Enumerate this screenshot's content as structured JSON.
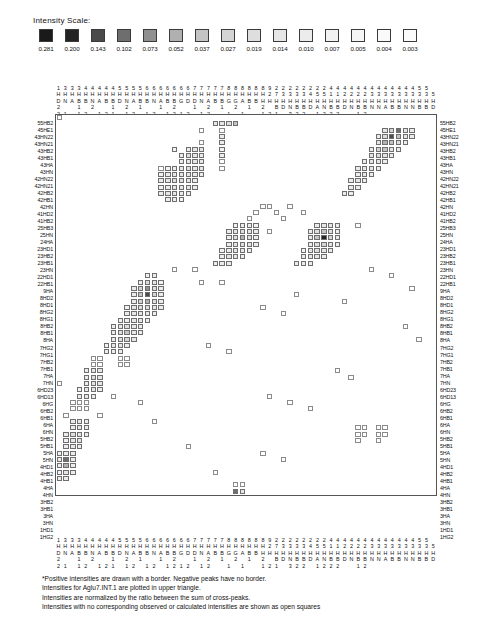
{
  "legend": {
    "title": "Intensity Scale:",
    "values": [
      "0.281",
      "0.200",
      "0.143",
      "0.102",
      "0.073",
      "0.052",
      "0.037",
      "0.027",
      "0.019",
      "0.014",
      "0.010",
      "0.007",
      "0.005",
      "0.004",
      "0.003"
    ],
    "colors": [
      "#1a1a1a",
      "#242424",
      "#4a4a4a",
      "#6e6e6e",
      "#909090",
      "#b0b0b0",
      "#c4c4c4",
      "#d4d4d4",
      "#dedede",
      "#e6e6e6",
      "#ececec",
      "#f2f2f2",
      "#f6f6f6",
      "#f9f9f9",
      "#fbfbfb"
    ]
  },
  "footnotes": [
    "*Positive intensities are drawn with a border.  Negative peaks have no border.",
    "Intensities for Aglu7.INT.1 are plotted in upper triangle.",
    "Intensities are normalized by the ratio between the sum of cross-peaks.",
    "Intensities with no corresponding observed or calculated intensities are shown as open squares"
  ],
  "axis": {
    "row_labels": [
      "55HB2",
      "45HE1",
      "43HN22",
      "43HN21",
      "43HB2",
      "43HB1",
      "43HA",
      "43HN",
      "42HN22",
      "42HN21",
      "42HB2",
      "42HB1",
      "42HN",
      "41HD2",
      "41HB2",
      "25HB3",
      "25HN",
      "24HA",
      "23HD1",
      "23HB2",
      "23HB1",
      "23HN",
      "22HD1",
      "22HB1",
      "9HA",
      "8HD2",
      "8HD1",
      "8HG2",
      "8HG1",
      "8HB2",
      "8HB1",
      "8HA",
      "7HG2",
      "7HG1",
      "7HB2",
      "7HB1",
      "7HA",
      "7HN",
      "6HD23",
      "6HD13",
      "6HG",
      "6HB2",
      "6HB1",
      "6HA",
      "6HN",
      "5HB2",
      "5HB1",
      "5HA",
      "5HN",
      "4HD1",
      "4HB2",
      "4HB1",
      "4HA",
      "4HN",
      "3HB2",
      "3HB1",
      "3HA",
      "3HN",
      "1HD1",
      "1HG2"
    ],
    "col_rows": [
      "1333444445555666666677777888888922222222444444444444455",
      "HHHHHHHHHHHHHHHHHHHHHHHHHHHHHHH2733334551122223333333335",
      "DNABBNABBDNABBNABBGDDNABBGGABBHHHHHHHHHHHHHHHHHHHHHHHHHH",
      "2  1 2  1 2 1  1 2  1 2 1 2 1 2 BDNBBDANBBDNBBNNABBNNBBD"
    ],
    "col_row4": "21 12 121 12 12 1212 12  1 1  121 322 1222  12"
  },
  "chart_data": {
    "type": "heatmap",
    "xlabel": "",
    "ylabel": "",
    "n_rows": 60,
    "n_cols": 56,
    "legend_position": "top",
    "scale_values": [
      0.281,
      0.2,
      0.143,
      0.102,
      0.073,
      0.052,
      0.037,
      0.027,
      0.019,
      0.014,
      0.01,
      0.007,
      0.005,
      0.004,
      0.003
    ],
    "note": "Cells encoded as [col, row, level] where level 0..14 maps to scale_values (0=darkest), level -1 = open square (no intensity).",
    "cells": [
      [
        0,
        0,
        -1
      ],
      [
        0,
        42,
        -1
      ],
      [
        23,
        1,
        9
      ],
      [
        24,
        1,
        9
      ],
      [
        25,
        1,
        8
      ],
      [
        26,
        1,
        6
      ],
      [
        21,
        2,
        -1
      ],
      [
        24,
        2,
        -1
      ],
      [
        24,
        3,
        10
      ],
      [
        21,
        4,
        -1
      ],
      [
        24,
        4,
        10
      ],
      [
        17,
        5,
        11
      ],
      [
        19,
        5,
        10
      ],
      [
        20,
        5,
        9
      ],
      [
        21,
        5,
        9
      ],
      [
        24,
        5,
        11
      ],
      [
        18,
        6,
        10
      ],
      [
        19,
        6,
        8
      ],
      [
        20,
        6,
        9
      ],
      [
        21,
        6,
        10
      ],
      [
        24,
        6,
        10
      ],
      [
        18,
        7,
        10
      ],
      [
        19,
        7,
        9
      ],
      [
        20,
        7,
        9
      ],
      [
        21,
        7,
        9
      ],
      [
        24,
        7,
        -1
      ],
      [
        15,
        8,
        -1
      ],
      [
        16,
        8,
        11
      ],
      [
        17,
        8,
        10
      ],
      [
        18,
        8,
        9
      ],
      [
        19,
        8,
        8
      ],
      [
        20,
        8,
        9
      ],
      [
        21,
        8,
        9
      ],
      [
        24,
        8,
        -1
      ],
      [
        15,
        9,
        11
      ],
      [
        16,
        9,
        10
      ],
      [
        17,
        9,
        9
      ],
      [
        18,
        9,
        9
      ],
      [
        19,
        9,
        9
      ],
      [
        20,
        9,
        10
      ],
      [
        21,
        9,
        10
      ],
      [
        15,
        10,
        10
      ],
      [
        16,
        10,
        9
      ],
      [
        17,
        10,
        8
      ],
      [
        18,
        10,
        8
      ],
      [
        19,
        10,
        9
      ],
      [
        20,
        10,
        10
      ],
      [
        15,
        11,
        11
      ],
      [
        16,
        11,
        10
      ],
      [
        17,
        11,
        9
      ],
      [
        18,
        11,
        9
      ],
      [
        19,
        11,
        9
      ],
      [
        20,
        11,
        10
      ],
      [
        15,
        12,
        10
      ],
      [
        16,
        12,
        9
      ],
      [
        17,
        12,
        9
      ],
      [
        18,
        12,
        10
      ],
      [
        19,
        12,
        10
      ],
      [
        16,
        13,
        10
      ],
      [
        17,
        13,
        10
      ],
      [
        18,
        13,
        11
      ],
      [
        48,
        2,
        9
      ],
      [
        49,
        2,
        7
      ],
      [
        50,
        2,
        3
      ],
      [
        51,
        2,
        9
      ],
      [
        52,
        2,
        10
      ],
      [
        47,
        3,
        10
      ],
      [
        48,
        3,
        8
      ],
      [
        49,
        3,
        2
      ],
      [
        50,
        3,
        6
      ],
      [
        51,
        3,
        9
      ],
      [
        52,
        3,
        10
      ],
      [
        47,
        4,
        9
      ],
      [
        48,
        4,
        5
      ],
      [
        49,
        4,
        6
      ],
      [
        50,
        4,
        8
      ],
      [
        51,
        4,
        10
      ],
      [
        46,
        5,
        10
      ],
      [
        47,
        5,
        7
      ],
      [
        48,
        5,
        6
      ],
      [
        49,
        5,
        9
      ],
      [
        50,
        5,
        10
      ],
      [
        46,
        6,
        9
      ],
      [
        47,
        6,
        8
      ],
      [
        48,
        6,
        9
      ],
      [
        49,
        6,
        10
      ],
      [
        45,
        7,
        10
      ],
      [
        46,
        7,
        9
      ],
      [
        47,
        7,
        9
      ],
      [
        48,
        7,
        10
      ],
      [
        44,
        8,
        10
      ],
      [
        45,
        8,
        9
      ],
      [
        46,
        8,
        9
      ],
      [
        47,
        8,
        10
      ],
      [
        44,
        9,
        10
      ],
      [
        45,
        9,
        9
      ],
      [
        46,
        9,
        10
      ],
      [
        43,
        10,
        10
      ],
      [
        44,
        10,
        9
      ],
      [
        45,
        10,
        10
      ],
      [
        43,
        11,
        10
      ],
      [
        44,
        11,
        10
      ],
      [
        42,
        12,
        10
      ],
      [
        43,
        12,
        10
      ],
      [
        30,
        14,
        -1
      ],
      [
        31,
        14,
        -1
      ],
      [
        34,
        14,
        -1
      ],
      [
        29,
        15,
        -1
      ],
      [
        32,
        15,
        -1
      ],
      [
        36,
        15,
        -1
      ],
      [
        28,
        16,
        -1
      ],
      [
        33,
        16,
        -1
      ],
      [
        26,
        17,
        11
      ],
      [
        27,
        17,
        10
      ],
      [
        28,
        17,
        10
      ],
      [
        29,
        17,
        11
      ],
      [
        25,
        18,
        10
      ],
      [
        26,
        18,
        9
      ],
      [
        27,
        18,
        8
      ],
      [
        28,
        18,
        9
      ],
      [
        29,
        18,
        10
      ],
      [
        31,
        18,
        -1
      ],
      [
        25,
        19,
        10
      ],
      [
        26,
        19,
        8
      ],
      [
        27,
        19,
        5
      ],
      [
        28,
        19,
        8
      ],
      [
        29,
        19,
        10
      ],
      [
        25,
        20,
        10
      ],
      [
        26,
        20,
        9
      ],
      [
        27,
        20,
        8
      ],
      [
        28,
        20,
        9
      ],
      [
        29,
        20,
        10
      ],
      [
        24,
        21,
        11
      ],
      [
        25,
        21,
        10
      ],
      [
        26,
        21,
        9
      ],
      [
        27,
        21,
        9
      ],
      [
        28,
        21,
        10
      ],
      [
        24,
        22,
        10
      ],
      [
        25,
        22,
        9
      ],
      [
        26,
        22,
        9
      ],
      [
        27,
        22,
        10
      ],
      [
        23,
        23,
        10
      ],
      [
        24,
        23,
        10
      ],
      [
        25,
        23,
        10
      ],
      [
        38,
        17,
        10
      ],
      [
        39,
        17,
        9
      ],
      [
        40,
        17,
        9
      ],
      [
        41,
        17,
        10
      ],
      [
        44,
        17,
        -1
      ],
      [
        37,
        18,
        10
      ],
      [
        38,
        18,
        8
      ],
      [
        39,
        18,
        6
      ],
      [
        40,
        18,
        8
      ],
      [
        41,
        18,
        10
      ],
      [
        37,
        19,
        9
      ],
      [
        38,
        19,
        6
      ],
      [
        39,
        19,
        1
      ],
      [
        40,
        19,
        7
      ],
      [
        41,
        19,
        9
      ],
      [
        37,
        20,
        10
      ],
      [
        38,
        20,
        8
      ],
      [
        39,
        20,
        7
      ],
      [
        40,
        20,
        9
      ],
      [
        41,
        20,
        10
      ],
      [
        36,
        21,
        11
      ],
      [
        37,
        21,
        9
      ],
      [
        38,
        21,
        8
      ],
      [
        39,
        21,
        9
      ],
      [
        40,
        21,
        10
      ],
      [
        36,
        22,
        10
      ],
      [
        37,
        22,
        9
      ],
      [
        38,
        22,
        9
      ],
      [
        39,
        22,
        10
      ],
      [
        35,
        23,
        10
      ],
      [
        36,
        23,
        10
      ],
      [
        37,
        23,
        10
      ],
      [
        13,
        25,
        11
      ],
      [
        14,
        25,
        10
      ],
      [
        12,
        26,
        10
      ],
      [
        13,
        26,
        8
      ],
      [
        14,
        26,
        9
      ],
      [
        15,
        26,
        11
      ],
      [
        11,
        27,
        10
      ],
      [
        12,
        27,
        7
      ],
      [
        13,
        27,
        4
      ],
      [
        14,
        27,
        8
      ],
      [
        15,
        27,
        10
      ],
      [
        11,
        28,
        10
      ],
      [
        12,
        28,
        6
      ],
      [
        13,
        28,
        2
      ],
      [
        14,
        28,
        7
      ],
      [
        15,
        28,
        10
      ],
      [
        11,
        29,
        10
      ],
      [
        12,
        29,
        7
      ],
      [
        13,
        29,
        5
      ],
      [
        14,
        29,
        8
      ],
      [
        15,
        29,
        10
      ],
      [
        10,
        30,
        11
      ],
      [
        11,
        30,
        9
      ],
      [
        12,
        30,
        8
      ],
      [
        13,
        30,
        8
      ],
      [
        14,
        30,
        9
      ],
      [
        15,
        30,
        10
      ],
      [
        10,
        31,
        10
      ],
      [
        11,
        31,
        9
      ],
      [
        12,
        31,
        9
      ],
      [
        13,
        31,
        9
      ],
      [
        14,
        31,
        10
      ],
      [
        9,
        32,
        11
      ],
      [
        10,
        32,
        10
      ],
      [
        11,
        32,
        9
      ],
      [
        12,
        32,
        9
      ],
      [
        13,
        32,
        10
      ],
      [
        8,
        33,
        10
      ],
      [
        9,
        33,
        9
      ],
      [
        10,
        33,
        8
      ],
      [
        11,
        33,
        9
      ],
      [
        12,
        33,
        10
      ],
      [
        8,
        34,
        10
      ],
      [
        9,
        34,
        8
      ],
      [
        10,
        34,
        6
      ],
      [
        11,
        34,
        9
      ],
      [
        12,
        34,
        10
      ],
      [
        8,
        35,
        10
      ],
      [
        9,
        35,
        8
      ],
      [
        10,
        35,
        7
      ],
      [
        11,
        35,
        9
      ],
      [
        7,
        36,
        11
      ],
      [
        8,
        36,
        9
      ],
      [
        9,
        36,
        9
      ],
      [
        10,
        36,
        10
      ],
      [
        7,
        37,
        10
      ],
      [
        8,
        37,
        10
      ],
      [
        9,
        37,
        10
      ],
      [
        21,
        26,
        -1
      ],
      [
        24,
        26,
        -1
      ],
      [
        30,
        30,
        -1
      ],
      [
        33,
        31,
        -1
      ],
      [
        5,
        38,
        -1
      ],
      [
        6,
        38,
        -1
      ],
      [
        9,
        38,
        -1
      ],
      [
        10,
        38,
        -1
      ],
      [
        5,
        39,
        -1
      ],
      [
        6,
        39,
        -1
      ],
      [
        9,
        39,
        -1
      ],
      [
        10,
        39,
        -1
      ],
      [
        4,
        40,
        10
      ],
      [
        5,
        40,
        9
      ],
      [
        6,
        40,
        9
      ],
      [
        4,
        41,
        10
      ],
      [
        5,
        41,
        8
      ],
      [
        6,
        41,
        9
      ],
      [
        4,
        42,
        10
      ],
      [
        5,
        42,
        9
      ],
      [
        6,
        42,
        9
      ],
      [
        3,
        43,
        11
      ],
      [
        4,
        43,
        9
      ],
      [
        5,
        43,
        9
      ],
      [
        6,
        43,
        10
      ],
      [
        3,
        44,
        10
      ],
      [
        4,
        44,
        9
      ],
      [
        5,
        44,
        10
      ],
      [
        2,
        45,
        -1
      ],
      [
        3,
        45,
        -1
      ],
      [
        4,
        45,
        -1
      ],
      [
        2,
        46,
        -1
      ],
      [
        3,
        46,
        -1
      ],
      [
        4,
        46,
        -1
      ],
      [
        1,
        47,
        -1
      ],
      [
        2,
        48,
        10
      ],
      [
        3,
        48,
        9
      ],
      [
        4,
        48,
        10
      ],
      [
        2,
        49,
        10
      ],
      [
        3,
        49,
        9
      ],
      [
        4,
        49,
        10
      ],
      [
        1,
        50,
        10
      ],
      [
        2,
        50,
        8
      ],
      [
        3,
        50,
        9
      ],
      [
        4,
        50,
        10
      ],
      [
        1,
        51,
        11
      ],
      [
        2,
        51,
        9
      ],
      [
        3,
        51,
        9
      ],
      [
        1,
        52,
        10
      ],
      [
        2,
        52,
        9
      ],
      [
        3,
        52,
        10
      ],
      [
        0,
        53,
        11
      ],
      [
        1,
        53,
        10
      ],
      [
        2,
        53,
        10
      ],
      [
        0,
        54,
        10
      ],
      [
        1,
        54,
        3
      ],
      [
        2,
        54,
        10
      ],
      [
        0,
        55,
        10
      ],
      [
        1,
        55,
        5
      ],
      [
        2,
        55,
        10
      ],
      [
        0,
        56,
        11
      ],
      [
        1,
        56,
        9
      ],
      [
        2,
        56,
        10
      ],
      [
        0,
        57,
        10
      ],
      [
        1,
        57,
        10
      ],
      [
        26,
        58,
        -1
      ],
      [
        27,
        58,
        -1
      ],
      [
        26,
        59,
        3
      ],
      [
        27,
        59,
        9
      ],
      [
        31,
        44,
        -1
      ],
      [
        34,
        45,
        -1
      ],
      [
        37,
        46,
        -1
      ],
      [
        44,
        49,
        -1
      ],
      [
        45,
        49,
        -1
      ],
      [
        47,
        49,
        -1
      ],
      [
        48,
        49,
        -1
      ],
      [
        44,
        50,
        -1
      ],
      [
        45,
        50,
        -1
      ],
      [
        47,
        50,
        -1
      ],
      [
        48,
        50,
        -1
      ],
      [
        44,
        51,
        -1
      ],
      [
        47,
        51,
        -1
      ],
      [
        30,
        53,
        -1
      ],
      [
        33,
        54,
        -1
      ],
      [
        17,
        24,
        -1
      ],
      [
        20,
        24,
        -1
      ],
      [
        35,
        28,
        -1
      ],
      [
        42,
        29,
        -1
      ],
      [
        8,
        44,
        -1
      ],
      [
        12,
        45,
        -1
      ],
      [
        46,
        24,
        -1
      ],
      [
        49,
        25,
        -1
      ],
      [
        52,
        27,
        -1
      ],
      [
        51,
        33,
        -1
      ],
      [
        53,
        35,
        -1
      ],
      [
        22,
        36,
        -1
      ],
      [
        25,
        37,
        -1
      ],
      [
        41,
        40,
        -1
      ],
      [
        43,
        41,
        -1
      ],
      [
        6,
        47,
        -1
      ],
      [
        14,
        48,
        -1
      ],
      [
        19,
        52,
        -1
      ],
      [
        23,
        56,
        -1
      ]
    ]
  }
}
